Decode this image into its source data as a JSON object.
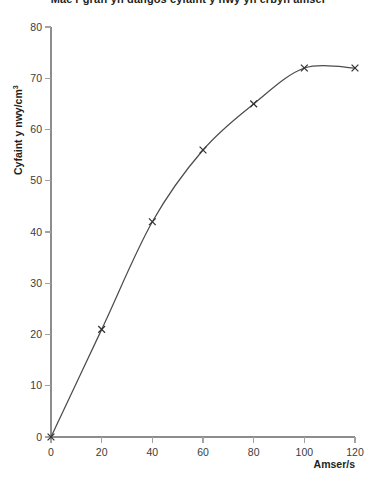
{
  "chart_data": {
    "type": "line",
    "title": "Mae'r graff yn dangos cyfaint y nwy yn erbyn amser",
    "xlabel": "Amser/s",
    "ylabel": "Cyfaint y nwy/cm",
    "ylabel_superscript": "3",
    "x": [
      0,
      20,
      40,
      60,
      80,
      100,
      120
    ],
    "values": [
      0,
      21,
      42,
      56,
      65,
      72,
      72
    ],
    "series": [
      {
        "name": "Cyfaint y nwy",
        "values": [
          0,
          21,
          42,
          56,
          65,
          72,
          72
        ]
      }
    ],
    "xlim": [
      0,
      120
    ],
    "ylim": [
      0,
      80
    ],
    "xticks": [
      0,
      20,
      40,
      60,
      80,
      100,
      120
    ],
    "yticks": [
      0,
      10,
      20,
      30,
      40,
      50,
      60,
      70,
      80
    ],
    "xtick_labels": [
      "0",
      "20",
      "40",
      "60",
      "80",
      "100",
      "120"
    ],
    "ytick_labels": [
      "0",
      "10",
      "20",
      "30",
      "40",
      "50",
      "60",
      "70",
      "80"
    ],
    "grid": false,
    "legend": false,
    "marker": "x",
    "line_color": "#4c4c4c",
    "marker_color": "#333333",
    "axis_color": "#8d8d8d",
    "text_color": "#231f20",
    "background": "#ffffff"
  }
}
